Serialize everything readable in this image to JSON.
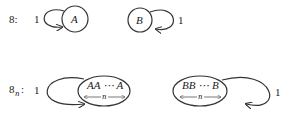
{
  "diagram": {
    "row1": {
      "label": "8:",
      "left_graph": {
        "loop_weight": "1",
        "node": "A"
      },
      "right_graph": {
        "node": "B",
        "loop_weight": "1"
      }
    },
    "row2": {
      "label_main": "8",
      "label_sub": "n",
      "label_colon": ":",
      "left_graph": {
        "loop_weight": "1",
        "node": "AA ⋯ A",
        "span_label": "n"
      },
      "right_graph": {
        "node": "BB ⋯ B",
        "span_label": "n",
        "loop_weight": "1"
      }
    }
  }
}
